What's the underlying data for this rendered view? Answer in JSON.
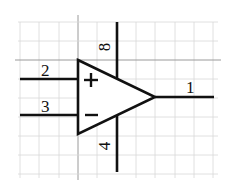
{
  "diagram": {
    "type": "op-amp-symbol",
    "pins": {
      "non_inverting_input": "2",
      "inverting_input": "3",
      "output": "1",
      "positive_supply": "8",
      "negative_supply": "4"
    },
    "symbols": {
      "plus": "+",
      "minus": "−"
    },
    "colors": {
      "line": "#111111",
      "grid": "#d8d8d8",
      "background": "#ffffff"
    }
  }
}
